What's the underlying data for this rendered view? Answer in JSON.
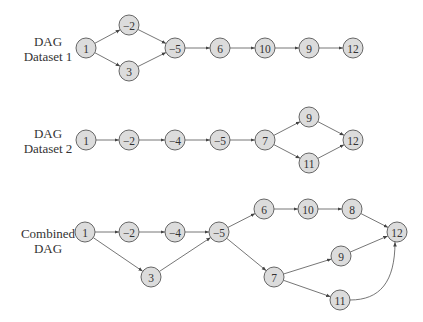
{
  "style": {
    "node_fill": "#dcdcdc",
    "node_stroke": "#666666",
    "edge_color": "#666666",
    "text_color": "#333333"
  },
  "graphs": [
    {
      "id": "dataset1",
      "label_line1": "DAG",
      "label_line2": "Dataset 1",
      "nodes": [
        {
          "id": "1",
          "label": "1",
          "x": 86,
          "y": 48
        },
        {
          "id": "-2",
          "label": "−2",
          "x": 129,
          "y": 25
        },
        {
          "id": "3",
          "label": "3",
          "x": 129,
          "y": 71
        },
        {
          "id": "-5",
          "label": "−5",
          "x": 175,
          "y": 48
        },
        {
          "id": "6",
          "label": "6",
          "x": 220,
          "y": 48
        },
        {
          "id": "10",
          "label": "10",
          "x": 265,
          "y": 48
        },
        {
          "id": "9",
          "label": "9",
          "x": 309,
          "y": 48
        },
        {
          "id": "12",
          "label": "12",
          "x": 353,
          "y": 48
        }
      ],
      "edges": [
        [
          "1",
          "-2"
        ],
        [
          "1",
          "3"
        ],
        [
          "-2",
          "-5"
        ],
        [
          "3",
          "-5"
        ],
        [
          "-5",
          "6"
        ],
        [
          "6",
          "10"
        ],
        [
          "10",
          "9"
        ],
        [
          "9",
          "12"
        ]
      ]
    },
    {
      "id": "dataset2",
      "label_line1": "DAG",
      "label_line2": "Dataset 2",
      "nodes": [
        {
          "id": "1",
          "label": "1",
          "x": 86,
          "y": 140
        },
        {
          "id": "-2",
          "label": "−2",
          "x": 129,
          "y": 140
        },
        {
          "id": "-4",
          "label": "−4",
          "x": 175,
          "y": 140
        },
        {
          "id": "-5",
          "label": "−5",
          "x": 220,
          "y": 140
        },
        {
          "id": "7",
          "label": "7",
          "x": 265,
          "y": 140
        },
        {
          "id": "9",
          "label": "9",
          "x": 309,
          "y": 117
        },
        {
          "id": "11",
          "label": "11",
          "x": 309,
          "y": 163
        },
        {
          "id": "12",
          "label": "12",
          "x": 353,
          "y": 140
        }
      ],
      "edges": [
        [
          "1",
          "-2"
        ],
        [
          "-2",
          "-4"
        ],
        [
          "-4",
          "-5"
        ],
        [
          "-5",
          "7"
        ],
        [
          "7",
          "9"
        ],
        [
          "7",
          "11"
        ],
        [
          "9",
          "12"
        ],
        [
          "11",
          "12"
        ]
      ]
    },
    {
      "id": "combined",
      "label_line1": "Combined",
      "label_line2": "DAG",
      "nodes": [
        {
          "id": "1",
          "label": "1",
          "x": 85,
          "y": 232
        },
        {
          "id": "-2",
          "label": "−2",
          "x": 129,
          "y": 232
        },
        {
          "id": "-4",
          "label": "−4",
          "x": 175,
          "y": 232
        },
        {
          "id": "-5",
          "label": "−5",
          "x": 219,
          "y": 232
        },
        {
          "id": "3",
          "label": "3",
          "x": 151,
          "y": 277
        },
        {
          "id": "6",
          "label": "6",
          "x": 264,
          "y": 209
        },
        {
          "id": "10",
          "label": "10",
          "x": 308,
          "y": 209
        },
        {
          "id": "8",
          "label": "8",
          "x": 352,
          "y": 209
        },
        {
          "id": "7",
          "label": "7",
          "x": 274,
          "y": 277
        },
        {
          "id": "9",
          "label": "9",
          "x": 341,
          "y": 256
        },
        {
          "id": "11",
          "label": "11",
          "x": 340,
          "y": 300
        },
        {
          "id": "12",
          "label": "12",
          "x": 397,
          "y": 232
        }
      ],
      "edges": [
        [
          "1",
          "-2"
        ],
        [
          "-2",
          "-4"
        ],
        [
          "-4",
          "-5"
        ],
        [
          "1",
          "3"
        ],
        [
          "3",
          "-5"
        ],
        [
          "-5",
          "6"
        ],
        [
          "6",
          "10"
        ],
        [
          "10",
          "8"
        ],
        [
          "8",
          "12"
        ],
        [
          "-5",
          "7"
        ],
        [
          "7",
          "9"
        ],
        [
          "9",
          "12"
        ],
        [
          "7",
          "11"
        ],
        [
          "11",
          "12",
          "curve"
        ]
      ]
    }
  ]
}
